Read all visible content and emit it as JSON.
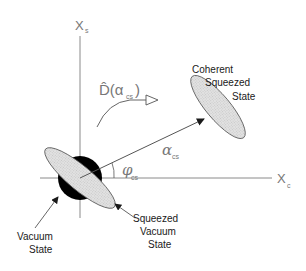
{
  "axes": {
    "x_label": "X",
    "x_sub": "c",
    "y_label": "X",
    "y_sub": "s"
  },
  "operator": {
    "label": "D̂(α",
    "sub": "cs",
    "close": ")"
  },
  "labels": {
    "coherent_squeezed": [
      "Coherent",
      "Squeezed",
      "State"
    ],
    "vacuum": [
      "Vacuum",
      "State"
    ],
    "squeezed_vacuum": [
      "Squeezed",
      "Vacuum",
      "State"
    ],
    "alpha": "α",
    "alpha_sub": "cs",
    "phi": "φ",
    "phi_sub": "cs"
  },
  "colors": {
    "axis": "#888888",
    "ellipse_fill": "#d9d9d9",
    "vacuum_fill": "#000000",
    "text": "#1a1a1a"
  }
}
